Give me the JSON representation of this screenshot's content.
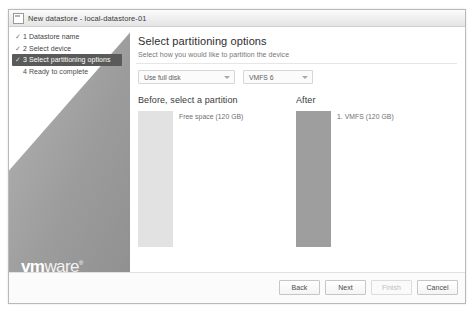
{
  "window": {
    "title": "New datastore - local-datastore-01",
    "icon": "window-icon"
  },
  "sidebar": {
    "logo": {
      "bold_part": "vm",
      "light_part": "ware",
      "trademark": "®"
    },
    "steps": [
      {
        "check": "✓",
        "label": "1 Datastore name",
        "state": "done"
      },
      {
        "check": "✓",
        "label": "2 Select device",
        "state": "done"
      },
      {
        "check": "✓",
        "label": "3 Select partitioning options",
        "state": "active"
      },
      {
        "check": "",
        "label": "4 Ready to complete",
        "state": "pending"
      }
    ]
  },
  "main": {
    "title": "Select partitioning options",
    "subtitle": "Select how you would like to partition the device",
    "selects": {
      "scheme": {
        "value": "Use full disk",
        "caret": "chevron-down-icon"
      },
      "format": {
        "value": "VMFS 6",
        "caret": "chevron-down-icon"
      }
    },
    "before": {
      "heading": "Before, select a partition",
      "partition_label": "Free space  (120 GB)"
    },
    "after": {
      "heading": "After",
      "partition_label": "1. VMFS  (120 GB)"
    }
  },
  "footer": {
    "buttons": [
      {
        "label": "Back",
        "state": "enabled"
      },
      {
        "label": "Next",
        "state": "enabled"
      },
      {
        "label": "Finish",
        "state": "disabled"
      },
      {
        "label": "Cancel",
        "state": "enabled"
      }
    ]
  },
  "colors": {
    "active_step_bg": "#5a5a5a",
    "sidebar_gray": "#9c9c9c",
    "free_space_bar": "#e2e2e2",
    "vmfs_bar": "#9e9e9e"
  }
}
